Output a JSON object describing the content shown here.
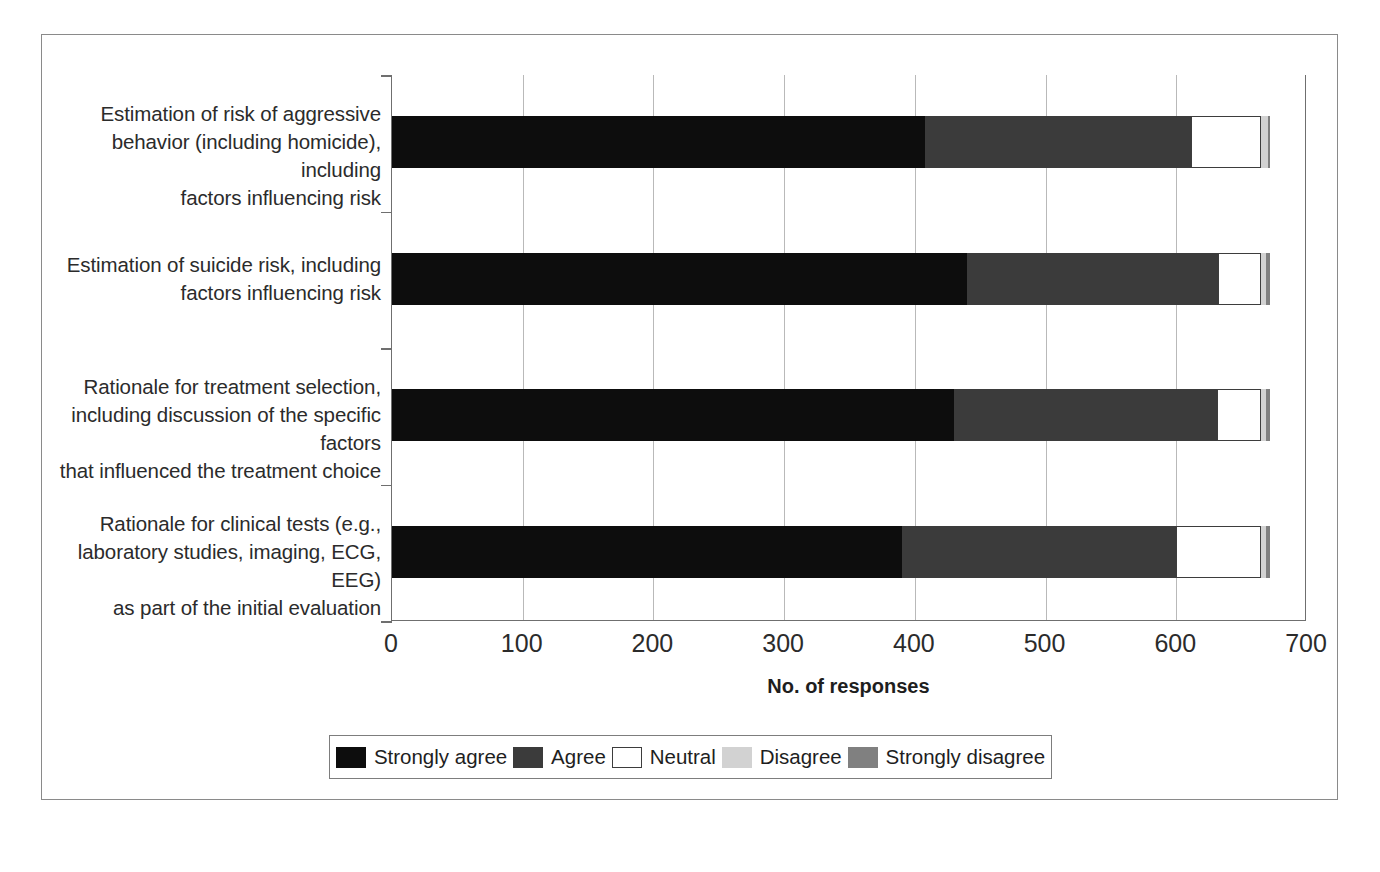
{
  "chart_data": {
    "type": "bar",
    "subtype": "stacked-horizontal-bar",
    "title": "",
    "xlabel": "No. of responses",
    "ylabel": "",
    "xlim": [
      0,
      700
    ],
    "xticks": [
      0,
      100,
      200,
      300,
      400,
      500,
      600,
      700
    ],
    "xtick_labels": [
      "0",
      "100",
      "200",
      "300",
      "400",
      "500",
      "600",
      "700"
    ],
    "grid": "vertical",
    "legend_position": "bottom",
    "categories": [
      "Estimation of risk of aggressive behavior (including homicide), including factors influencing risk",
      "Estimation of suicide risk, including factors influencing risk",
      "Rationale for treatment selection, including discussion of the specific factors that influenced the treatment choice",
      "Rationale for clinical tests (e.g., laboratory studies, imaging, ECG, EEG) as part of the initial evaluation"
    ],
    "category_label_lines": [
      [
        "Estimation of risk of aggressive",
        "behavior (including homicide), including",
        "factors influencing risk"
      ],
      [
        "Estimation of suicide risk, including",
        "factors influencing risk"
      ],
      [
        "Rationale for treatment selection,",
        "including discussion of the specific factors",
        "that influenced the treatment choice"
      ],
      [
        "Rationale for clinical tests (e.g.,",
        "laboratory studies, imaging, ECG, EEG)",
        "as part of the initial evaluation"
      ]
    ],
    "series": [
      {
        "name": "Strongly agree",
        "color": "#0d0d0d",
        "values": [
          408,
          440,
          430,
          390
        ]
      },
      {
        "name": "Agree",
        "color": "#3b3b3b",
        "values": [
          203,
          192,
          201,
          210
        ]
      },
      {
        "name": "Neutral",
        "color": "#ffffff",
        "values": [
          54,
          33,
          34,
          65
        ]
      },
      {
        "name": "Disagree",
        "color": "#d2d2d2",
        "values": [
          5,
          4,
          4,
          4
        ]
      },
      {
        "name": "Strongly disagree",
        "color": "#808080",
        "values": [
          2,
          3,
          3,
          3
        ]
      }
    ],
    "totals": [
      672,
      672,
      672,
      672
    ]
  },
  "axis": {
    "title": "No. of responses",
    "ticks": [
      "0",
      "100",
      "200",
      "300",
      "400",
      "500",
      "600",
      "700"
    ]
  },
  "legend": {
    "items": [
      {
        "label": "Strongly agree",
        "color": "#0d0d0d"
      },
      {
        "label": "Agree",
        "color": "#3b3b3b"
      },
      {
        "label": "Neutral",
        "color": "#ffffff"
      },
      {
        "label": "Disagree",
        "color": "#d2d2d2"
      },
      {
        "label": "Strongly disagree",
        "color": "#808080"
      }
    ]
  },
  "colors": {
    "strongly_agree": "#0d0d0d",
    "agree": "#3b3b3b",
    "neutral": "#ffffff",
    "disagree": "#d2d2d2",
    "strongly_disagree": "#808080",
    "axis": "#6f6f6f",
    "grid": "#b9b9b9",
    "frame": "#8a8a8a",
    "text": "#2b2b2b"
  }
}
